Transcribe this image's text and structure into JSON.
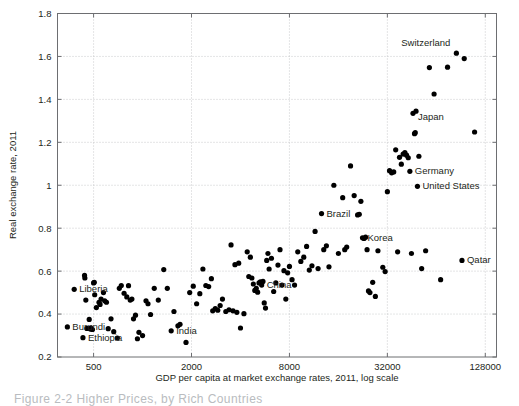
{
  "figure": {
    "caption_partial": "Figure  2-2   Higher  Prices, by Rich Countries"
  },
  "chart_data": {
    "type": "scatter",
    "title": "",
    "xlabel": "GDP per capita at market exchange rates, 2011, log scale",
    "ylabel": "Real exchange rate, 2011",
    "xscale": "log",
    "yscale": "linear",
    "xlim": [
      300,
      150000
    ],
    "ylim": [
      0.2,
      1.8
    ],
    "xticks": [
      500,
      2000,
      8000,
      32000,
      128000
    ],
    "xtick_labels": [
      "500",
      "2000",
      "8000",
      "32000",
      "128000"
    ],
    "yticks": [
      0.2,
      0.4,
      0.6,
      0.8,
      1.0,
      1.2,
      1.4,
      1.6,
      1.8
    ],
    "ytick_labels": [
      "0.2",
      "0.4",
      "0.6",
      "0.8",
      "1",
      "1.2",
      "1.4",
      "1.6",
      "1.8"
    ],
    "grid": true,
    "legend": "none",
    "marker": "filled-circle",
    "marker_color": "#000000",
    "annotations": [
      {
        "label": "Switzerland",
        "x": 85000,
        "y": 1.615,
        "dx": -6,
        "dy": -7,
        "align": "right"
      },
      {
        "label": "Japan",
        "x": 46000,
        "y": 1.335,
        "dx": 5,
        "dy": 7,
        "align": "left"
      },
      {
        "label": "Germany",
        "x": 44000,
        "y": 1.065,
        "dx": 5,
        "dy": 3,
        "align": "left"
      },
      {
        "label": "United States",
        "x": 49000,
        "y": 0.995,
        "dx": 5,
        "dy": 3,
        "align": "left"
      },
      {
        "label": "Brazil",
        "x": 12600,
        "y": 0.868,
        "dx": 5,
        "dy": 3,
        "align": "left"
      },
      {
        "label": "Korea",
        "x": 22500,
        "y": 0.755,
        "dx": 5,
        "dy": 3,
        "align": "left"
      },
      {
        "label": "Qatar",
        "x": 92000,
        "y": 0.65,
        "dx": 5,
        "dy": 3,
        "align": "left"
      },
      {
        "label": "China",
        "x": 5400,
        "y": 0.535,
        "dx": 5,
        "dy": 3,
        "align": "left"
      },
      {
        "label": "Liberia",
        "x": 380,
        "y": 0.515,
        "dx": 5,
        "dy": 3,
        "align": "left"
      },
      {
        "label": "India",
        "x": 1500,
        "y": 0.322,
        "dx": 5,
        "dy": 3,
        "align": "left"
      },
      {
        "label": "Burundi",
        "x": 345,
        "y": 0.34,
        "dx": 5,
        "dy": 3,
        "align": "left"
      },
      {
        "label": "Ethiopia",
        "x": 430,
        "y": 0.29,
        "dx": 5,
        "dy": 3,
        "align": "left"
      }
    ],
    "points": [
      [
        345,
        0.34
      ],
      [
        380,
        0.515
      ],
      [
        430,
        0.29
      ],
      [
        440,
        0.58
      ],
      [
        442,
        0.568
      ],
      [
        448,
        0.465
      ],
      [
        455,
        0.333
      ],
      [
        470,
        0.375
      ],
      [
        478,
        0.33
      ],
      [
        480,
        0.336
      ],
      [
        492,
        0.328
      ],
      [
        500,
        0.545
      ],
      [
        505,
        0.548
      ],
      [
        508,
        0.49
      ],
      [
        520,
        0.43
      ],
      [
        540,
        0.455
      ],
      [
        548,
        0.445
      ],
      [
        556,
        0.47
      ],
      [
        575,
        0.5
      ],
      [
        585,
        0.462
      ],
      [
        600,
        0.455
      ],
      [
        615,
        0.332
      ],
      [
        640,
        0.378
      ],
      [
        665,
        0.318
      ],
      [
        700,
        0.288
      ],
      [
        720,
        0.52
      ],
      [
        740,
        0.533
      ],
      [
        770,
        0.497
      ],
      [
        800,
        0.48
      ],
      [
        820,
        0.532
      ],
      [
        840,
        0.465
      ],
      [
        860,
        0.47
      ],
      [
        880,
        0.378
      ],
      [
        905,
        0.395
      ],
      [
        930,
        0.285
      ],
      [
        950,
        0.315
      ],
      [
        1000,
        0.3
      ],
      [
        1050,
        0.462
      ],
      [
        1080,
        0.448
      ],
      [
        1120,
        0.398
      ],
      [
        1180,
        0.52
      ],
      [
        1250,
        0.465
      ],
      [
        1350,
        0.607
      ],
      [
        1420,
        0.52
      ],
      [
        1500,
        0.322
      ],
      [
        1560,
        0.412
      ],
      [
        1650,
        0.345
      ],
      [
        1700,
        0.352
      ],
      [
        1850,
        0.268
      ],
      [
        1950,
        0.5
      ],
      [
        2050,
        0.53
      ],
      [
        2150,
        0.448
      ],
      [
        2250,
        0.495
      ],
      [
        2350,
        0.61
      ],
      [
        2450,
        0.533
      ],
      [
        2550,
        0.528
      ],
      [
        2650,
        0.565
      ],
      [
        2700,
        0.415
      ],
      [
        2800,
        0.425
      ],
      [
        2900,
        0.418
      ],
      [
        3000,
        0.44
      ],
      [
        3100,
        0.47
      ],
      [
        3250,
        0.412
      ],
      [
        3400,
        0.42
      ],
      [
        3500,
        0.722
      ],
      [
        3600,
        0.415
      ],
      [
        3700,
        0.63
      ],
      [
        3800,
        0.408
      ],
      [
        3900,
        0.637
      ],
      [
        4000,
        0.335
      ],
      [
        4200,
        0.402
      ],
      [
        4400,
        0.69
      ],
      [
        4500,
        0.575
      ],
      [
        4600,
        0.665
      ],
      [
        4700,
        0.568
      ],
      [
        4800,
        0.54
      ],
      [
        4900,
        0.51
      ],
      [
        5000,
        0.52
      ],
      [
        5100,
        0.502
      ],
      [
        5200,
        0.545
      ],
      [
        5300,
        0.55
      ],
      [
        5400,
        0.535
      ],
      [
        5500,
        0.552
      ],
      [
        5600,
        0.452
      ],
      [
        5700,
        0.428
      ],
      [
        5800,
        0.65
      ],
      [
        5900,
        0.682
      ],
      [
        6000,
        0.61
      ],
      [
        6200,
        0.66
      ],
      [
        6400,
        0.505
      ],
      [
        6600,
        0.545
      ],
      [
        6800,
        0.628
      ],
      [
        7000,
        0.7
      ],
      [
        7200,
        0.535
      ],
      [
        7400,
        0.602
      ],
      [
        7600,
        0.47
      ],
      [
        7800,
        0.592
      ],
      [
        8000,
        0.622
      ],
      [
        8300,
        0.56
      ],
      [
        8600,
        0.535
      ],
      [
        9000,
        0.69
      ],
      [
        9400,
        0.645
      ],
      [
        9800,
        0.665
      ],
      [
        10200,
        0.715
      ],
      [
        10600,
        0.605
      ],
      [
        11000,
        0.625
      ],
      [
        11500,
        0.785
      ],
      [
        12000,
        0.612
      ],
      [
        12600,
        0.868
      ],
      [
        13000,
        0.7
      ],
      [
        13500,
        0.718
      ],
      [
        14000,
        0.62
      ],
      [
        15000,
        1.0
      ],
      [
        16000,
        0.682
      ],
      [
        17000,
        0.942
      ],
      [
        17500,
        0.7
      ],
      [
        18000,
        0.712
      ],
      [
        19000,
        1.09
      ],
      [
        20000,
        0.952
      ],
      [
        21000,
        0.862
      ],
      [
        21500,
        0.865
      ],
      [
        22000,
        0.925
      ],
      [
        22500,
        0.755
      ],
      [
        23000,
        0.752
      ],
      [
        23500,
        0.758
      ],
      [
        24000,
        0.7
      ],
      [
        24500,
        0.508
      ],
      [
        25000,
        0.5
      ],
      [
        26000,
        0.548
      ],
      [
        27000,
        0.482
      ],
      [
        28000,
        0.695
      ],
      [
        30000,
        0.618
      ],
      [
        31000,
        0.598
      ],
      [
        32000,
        0.97
      ],
      [
        33000,
        1.068
      ],
      [
        34000,
        1.058
      ],
      [
        35000,
        1.062
      ],
      [
        36000,
        1.165
      ],
      [
        37000,
        0.69
      ],
      [
        38000,
        1.13
      ],
      [
        39000,
        1.098
      ],
      [
        40000,
        1.145
      ],
      [
        41000,
        1.152
      ],
      [
        42000,
        1.14
      ],
      [
        43000,
        1.128
      ],
      [
        44000,
        1.065
      ],
      [
        45000,
        0.682
      ],
      [
        46000,
        1.335
      ],
      [
        47000,
        1.24
      ],
      [
        47500,
        1.245
      ],
      [
        48000,
        1.345
      ],
      [
        49000,
        0.995
      ],
      [
        50000,
        1.135
      ],
      [
        52000,
        0.612
      ],
      [
        55000,
        0.695
      ],
      [
        58000,
        1.548
      ],
      [
        62000,
        1.425
      ],
      [
        68000,
        0.56
      ],
      [
        75000,
        1.55
      ],
      [
        85000,
        1.615
      ],
      [
        92000,
        0.65
      ],
      [
        95000,
        1.59
      ],
      [
        110000,
        1.248
      ]
    ]
  }
}
